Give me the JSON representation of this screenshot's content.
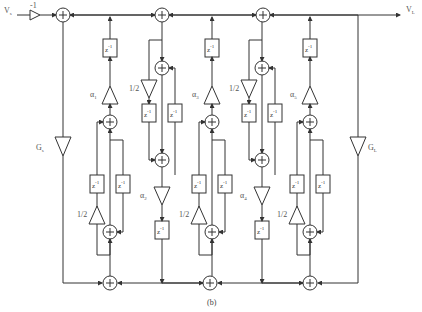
{
  "labels": {
    "source": "V",
    "source_sub": "s",
    "load": "V",
    "load_sub": "L",
    "input_gain": "-1",
    "source_conductance": "G",
    "source_conductance_sub": "s",
    "load_conductance": "G",
    "load_conductance_sub": "L",
    "delay": "z",
    "delay_exp": "-1",
    "half": "1/2",
    "plus": "+",
    "caption": "(b)"
  },
  "multipliers": [
    {
      "name": "α",
      "sub": "1"
    },
    {
      "name": "α",
      "sub": "2"
    },
    {
      "name": "α",
      "sub": "3"
    },
    {
      "name": "α",
      "sub": "4"
    },
    {
      "name": "α",
      "sub": "5"
    }
  ]
}
